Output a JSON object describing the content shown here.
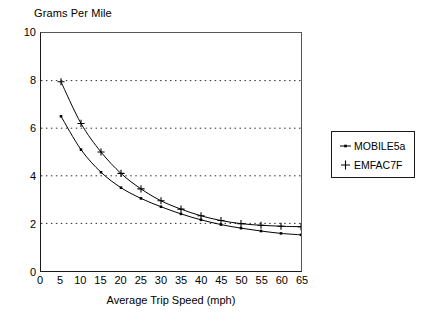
{
  "chart_data": {
    "type": "line",
    "title": "",
    "ylabel": "Grams Per Mile",
    "xlabel": "Average Trip Speed (mph)",
    "x": [
      5,
      10,
      15,
      20,
      25,
      30,
      35,
      40,
      45,
      50,
      55,
      60,
      65
    ],
    "xlim": [
      0,
      65
    ],
    "ylim": [
      0,
      10
    ],
    "xticks": [
      "0",
      "5",
      "10",
      "15",
      "20",
      "25",
      "30",
      "35",
      "40",
      "45",
      "50",
      "55",
      "60",
      "65"
    ],
    "xtick_values": [
      0,
      5,
      10,
      15,
      20,
      25,
      30,
      35,
      40,
      45,
      50,
      55,
      60,
      65
    ],
    "yticks": [
      "0",
      "2",
      "4",
      "6",
      "8",
      "10"
    ],
    "ytick_values": [
      0,
      2,
      4,
      6,
      8,
      10
    ],
    "grid": "horizontal-dotted",
    "gridlines_y": [
      2,
      4,
      6,
      8
    ],
    "legend_position": "outside-right",
    "series": [
      {
        "name": "MOBILE5a",
        "marker": "square-dot",
        "color": "#000000",
        "values": [
          6.5,
          5.1,
          4.15,
          3.5,
          3.05,
          2.7,
          2.4,
          2.15,
          1.95,
          1.8,
          1.68,
          1.58,
          1.52
        ]
      },
      {
        "name": "EMFAC7F",
        "marker": "plus",
        "color": "#000000",
        "values": [
          7.95,
          6.2,
          5.0,
          4.1,
          3.45,
          2.95,
          2.6,
          2.32,
          2.12,
          1.99,
          1.92,
          1.88,
          1.86
        ]
      }
    ]
  },
  "legend": {
    "entries": [
      {
        "label": "MOBILE5a",
        "marker": "square-dot"
      },
      {
        "label": "EMFAC7F",
        "marker": "plus"
      }
    ]
  }
}
